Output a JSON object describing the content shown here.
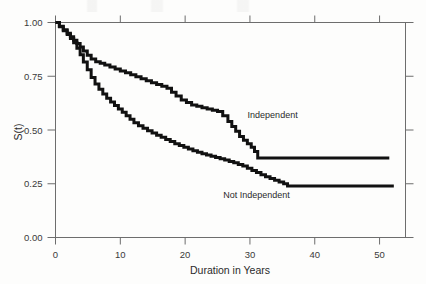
{
  "chart_data": {
    "type": "line",
    "title": "",
    "subtitle": "",
    "xlabel": "Duration in Years",
    "ylabel": "S(t)",
    "xlim": [
      0,
      54
    ],
    "ylim": [
      0.0,
      1.0
    ],
    "xticks": [
      0,
      10,
      20,
      30,
      40,
      50
    ],
    "xticklabels": [
      "0",
      "10",
      "20",
      "30",
      "40",
      "50"
    ],
    "yticks": [
      0.0,
      0.25,
      0.5,
      0.75,
      1.0
    ],
    "yticklabels": [
      "0.00",
      "0.25",
      "0.50",
      "0.75",
      "1.00"
    ],
    "grid": false,
    "legend_position": "inline-annotation",
    "line_color": "#111111",
    "frame_color": "#6d6d6d",
    "background_color": "#fdfdfc",
    "series": [
      {
        "name": "Independent",
        "annotation": "Independent",
        "annotation_x": 33.5,
        "annotation_y": 0.555,
        "step": "post",
        "plateau_value": 0.37,
        "plateau_start_x": 31.2,
        "plateau_end_x": 51.5,
        "x": [
          0,
          0.6,
          1.2,
          1.8,
          2.3,
          2.8,
          3.3,
          3.8,
          4.3,
          4.9,
          5.5,
          6.2,
          6.9,
          7.6,
          8.4,
          9.2,
          10.0,
          10.8,
          11.6,
          12.4,
          13.2,
          14.0,
          14.8,
          15.6,
          16.4,
          17.2,
          17.9,
          18.6,
          19.4,
          20.2,
          21.0,
          21.8,
          22.6,
          23.4,
          24.2,
          25.0,
          25.8,
          26.6,
          27.2,
          27.8,
          28.4,
          29.0,
          29.6,
          30.2,
          30.7,
          31.2,
          51.5
        ],
        "y": [
          1.0,
          0.982,
          0.966,
          0.95,
          0.934,
          0.918,
          0.902,
          0.886,
          0.868,
          0.848,
          0.83,
          0.818,
          0.81,
          0.802,
          0.793,
          0.784,
          0.775,
          0.766,
          0.757,
          0.748,
          0.738,
          0.729,
          0.72,
          0.712,
          0.703,
          0.694,
          0.676,
          0.658,
          0.64,
          0.628,
          0.616,
          0.61,
          0.604,
          0.598,
          0.592,
          0.586,
          0.566,
          0.54,
          0.516,
          0.494,
          0.47,
          0.452,
          0.436,
          0.42,
          0.4,
          0.37,
          0.37
        ]
      },
      {
        "name": "Not Independent",
        "annotation": "Not Independent",
        "annotation_x": 31.0,
        "annotation_y": 0.185,
        "step": "post",
        "plateau_value": 0.24,
        "plateau_start_x": 35.8,
        "plateau_end_x": 52.2,
        "x": [
          0,
          0.6,
          1.2,
          1.8,
          2.3,
          2.8,
          3.3,
          3.8,
          4.3,
          4.9,
          5.5,
          6.1,
          6.7,
          7.3,
          7.9,
          8.5,
          9.1,
          9.7,
          10.3,
          10.9,
          11.5,
          12.1,
          12.8,
          13.5,
          14.2,
          14.9,
          15.6,
          16.3,
          17.0,
          17.7,
          18.4,
          19.1,
          19.8,
          20.5,
          21.2,
          21.9,
          22.6,
          23.3,
          24.0,
          24.7,
          25.4,
          26.1,
          26.8,
          27.5,
          28.2,
          28.9,
          29.6,
          30.3,
          31.0,
          31.7,
          32.4,
          33.1,
          33.8,
          34.5,
          35.2,
          35.8,
          52.2
        ],
        "y": [
          1.0,
          0.98,
          0.962,
          0.944,
          0.926,
          0.906,
          0.88,
          0.85,
          0.816,
          0.78,
          0.744,
          0.714,
          0.69,
          0.668,
          0.648,
          0.63,
          0.614,
          0.598,
          0.582,
          0.566,
          0.55,
          0.534,
          0.52,
          0.508,
          0.496,
          0.486,
          0.476,
          0.466,
          0.456,
          0.446,
          0.436,
          0.428,
          0.42,
          0.412,
          0.404,
          0.396,
          0.39,
          0.384,
          0.378,
          0.372,
          0.366,
          0.36,
          0.354,
          0.348,
          0.34,
          0.332,
          0.322,
          0.312,
          0.302,
          0.292,
          0.282,
          0.274,
          0.266,
          0.258,
          0.25,
          0.24,
          0.24
        ]
      }
    ]
  }
}
